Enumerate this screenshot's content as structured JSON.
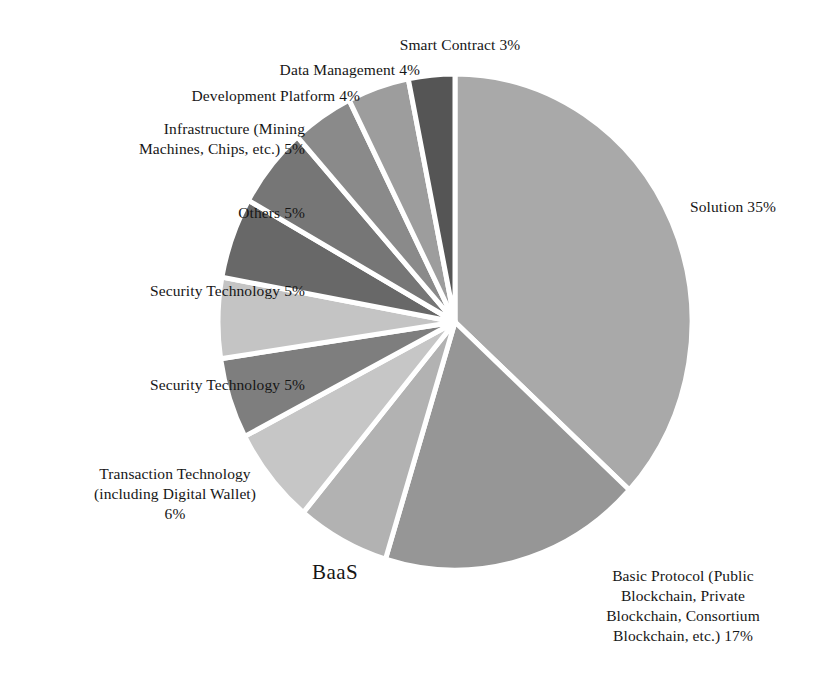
{
  "chart_data": {
    "type": "pie",
    "title": "",
    "legend_position": "none",
    "start_angle_deg": 0,
    "direction": "clockwise",
    "center": {
      "x": 455,
      "y": 322
    },
    "radius_x": 237,
    "radius_y": 248,
    "units": "percent",
    "labels": [
      "Solution",
      "Basic Protocol (Public Blockchain, Private Blockchain, Consortium Blockchain, etc.)",
      "BaaS",
      "Transaction Technology (including Digital Wallet)",
      "Security Technology",
      "Security Technology",
      "Others",
      "Infrastructure (Mining Machines, Chips, etc.)",
      "Development Platform",
      "Data Management",
      "Smart Contract"
    ],
    "values": [
      35,
      17,
      6,
      6,
      5,
      5,
      5,
      5,
      4,
      4,
      3
    ],
    "colors": [
      "#a9a9a9",
      "#969696",
      "#b2b2b2",
      "#c6c6c6",
      "#7e7e7e",
      "#c4c4c4",
      "#686868",
      "#767676",
      "#8a8a8a",
      "#9d9d9d",
      "#555555"
    ],
    "slice_gap_color": "#ffffff",
    "slice_gap_width": 5
  },
  "slices": [
    {
      "id": "solution",
      "name": "Solution",
      "value": 35,
      "color": "#a9a9a9",
      "label_text": "Solution 35%"
    },
    {
      "id": "basic-protocol",
      "name": "Basic Protocol (Public Blockchain, Private Blockchain, Consortium Blockchain, etc.)",
      "value": 17,
      "color": "#969696",
      "label_text": "Basic Protocol (Public\nBlockchain, Private\nBlockchain, Consortium\nBlockchain, etc.) 17%"
    },
    {
      "id": "baas",
      "name": "BaaS",
      "value": 6,
      "color": "#b2b2b2",
      "label_text": "BaaS"
    },
    {
      "id": "transaction-technology",
      "name": "Transaction Technology (including Digital Wallet)",
      "value": 6,
      "color": "#c6c6c6",
      "label_text": "Transaction Technology\n(including Digital Wallet)\n6%"
    },
    {
      "id": "security-technology-1",
      "name": "Security Technology",
      "value": 5,
      "color": "#7e7e7e",
      "label_text": "Security Technology 5%"
    },
    {
      "id": "security-technology-2",
      "name": "Security Technology",
      "value": 5,
      "color": "#c4c4c4",
      "label_text": "Security Technology 5%"
    },
    {
      "id": "others",
      "name": "Others",
      "value": 5,
      "color": "#686868",
      "label_text": "Others 5%"
    },
    {
      "id": "infrastructure",
      "name": "Infrastructure (Mining Machines, Chips, etc.)",
      "value": 5,
      "color": "#767676",
      "label_text": "Infrastructure (Mining\nMachines, Chips, etc.) 5%"
    },
    {
      "id": "development-platform",
      "name": "Development Platform",
      "value": 4,
      "color": "#8a8a8a",
      "label_text": "Development Platform 4%"
    },
    {
      "id": "data-management",
      "name": "Data Management",
      "value": 4,
      "color": "#9d9d9d",
      "label_text": "Data Management 4%"
    },
    {
      "id": "smart-contract",
      "name": "Smart Contract",
      "value": 3,
      "color": "#555555",
      "label_text": "Smart Contract 3%"
    }
  ]
}
